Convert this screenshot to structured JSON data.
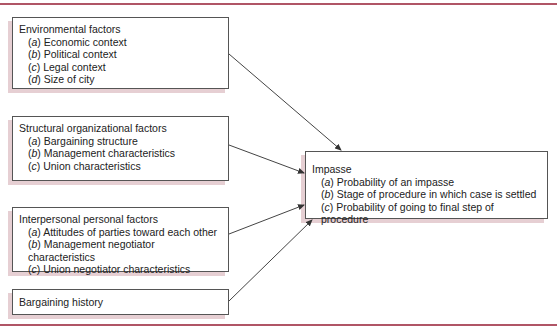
{
  "diagram": {
    "boxes": [
      {
        "id": "environmental",
        "title": "Environmental factors",
        "items": [
          {
            "letter": "a",
            "text": "Economic context"
          },
          {
            "letter": "b",
            "text": "Political context"
          },
          {
            "letter": "c",
            "text": "Legal context"
          },
          {
            "letter": "d",
            "text": "Size of city"
          }
        ]
      },
      {
        "id": "structural",
        "title": "Structural organizational factors",
        "items": [
          {
            "letter": "a",
            "text": "Bargaining structure"
          },
          {
            "letter": "b",
            "text": "Management characteristics"
          },
          {
            "letter": "c",
            "text": "Union characteristics"
          }
        ]
      },
      {
        "id": "interpersonal",
        "title": "Interpersonal personal factors",
        "items": [
          {
            "letter": "a",
            "text": "Attitudes of parties toward each other"
          },
          {
            "letter": "b",
            "text": "Management negotiator characteristics"
          },
          {
            "letter": "c",
            "text": "Union negotiator characteristics"
          }
        ]
      },
      {
        "id": "history",
        "title": "Bargaining history",
        "items": []
      },
      {
        "id": "impasse",
        "title": "Impasse",
        "items": [
          {
            "letter": "a",
            "text": "Probability of an impasse"
          },
          {
            "letter": "b",
            "text": "Stage of procedure in which case is settled"
          },
          {
            "letter": "c",
            "text": "Probability of going to final step of procedure"
          }
        ]
      }
    ],
    "edges": [
      {
        "from": "environmental",
        "to": "impasse"
      },
      {
        "from": "structural",
        "to": "impasse"
      },
      {
        "from": "interpersonal",
        "to": "impasse"
      },
      {
        "from": "history",
        "to": "impasse"
      }
    ],
    "colors": {
      "rule": "#b05566",
      "shadow": "#e6cfd3",
      "border": "#555555"
    }
  }
}
